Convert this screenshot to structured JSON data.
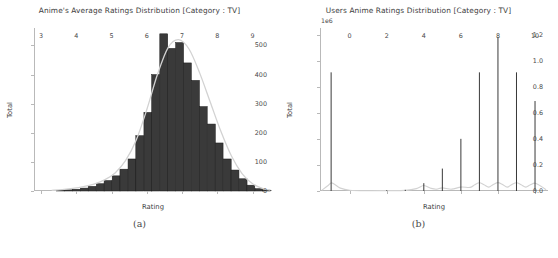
{
  "figure": {
    "width": 558,
    "height": 258,
    "background": "#ffffff",
    "footer_fragment": ""
  },
  "panels": [
    {
      "caption": "(a)",
      "chart_data": {
        "type": "bar",
        "title": "Anime's Average Ratings Distribution [Category : TV]",
        "xlabel": "Rating",
        "ylabel": "Total",
        "xlim": [
          2.8,
          9.55
        ],
        "ylim": [
          0,
          560
        ],
        "xticks": [
          3,
          4,
          5,
          6,
          7,
          8,
          9
        ],
        "xticklabels": [
          "3",
          "4",
          "5",
          "6",
          "7",
          "8",
          "9"
        ],
        "yticks": [
          0,
          100,
          200,
          300,
          400,
          500
        ],
        "yticklabels": [
          "0",
          "100",
          "200",
          "300",
          "400",
          "500"
        ],
        "grid": false,
        "legend": null,
        "bar_color": "#3a3a3a",
        "bar_edge_color": "#1a1a1a",
        "kde_color": "#d2d2d2",
        "bin_width": 0.225,
        "bin_centers": [
          3.55,
          3.78,
          4.0,
          4.23,
          4.45,
          4.68,
          4.9,
          5.13,
          5.35,
          5.58,
          5.8,
          6.03,
          6.25,
          6.48,
          6.7,
          6.93,
          7.15,
          7.38,
          7.6,
          7.83,
          8.05,
          8.28,
          8.5,
          8.73,
          8.95,
          9.18,
          9.4
        ],
        "values": [
          2,
          4,
          6,
          10,
          16,
          25,
          36,
          52,
          75,
          110,
          190,
          270,
          400,
          540,
          490,
          510,
          440,
          380,
          290,
          230,
          165,
          110,
          72,
          42,
          20,
          8,
          3
        ],
        "kde_points": [
          {
            "x": 3.3,
            "y": 2
          },
          {
            "x": 3.6,
            "y": 5
          },
          {
            "x": 3.9,
            "y": 9
          },
          {
            "x": 4.2,
            "y": 15
          },
          {
            "x": 4.5,
            "y": 24
          },
          {
            "x": 4.8,
            "y": 38
          },
          {
            "x": 5.1,
            "y": 62
          },
          {
            "x": 5.4,
            "y": 105
          },
          {
            "x": 5.7,
            "y": 175
          },
          {
            "x": 6.0,
            "y": 280
          },
          {
            "x": 6.3,
            "y": 400
          },
          {
            "x": 6.6,
            "y": 492
          },
          {
            "x": 6.9,
            "y": 520
          },
          {
            "x": 7.2,
            "y": 487
          },
          {
            "x": 7.5,
            "y": 405
          },
          {
            "x": 7.8,
            "y": 305
          },
          {
            "x": 8.1,
            "y": 205
          },
          {
            "x": 8.4,
            "y": 120
          },
          {
            "x": 8.7,
            "y": 60
          },
          {
            "x": 9.0,
            "y": 25
          },
          {
            "x": 9.3,
            "y": 8
          },
          {
            "x": 9.5,
            "y": 3
          }
        ]
      }
    },
    {
      "caption": "(b)",
      "chart_data": {
        "type": "bar",
        "title": "Users Anime Ratings Distribution [Category : TV]",
        "xlabel": "Rating",
        "ylabel": "Total",
        "y_exponent_label": "1e6",
        "xlim": [
          -1.6,
          10.7
        ],
        "ylim": [
          0,
          1250000
        ],
        "xticks": [
          0,
          2,
          4,
          6,
          8,
          10
        ],
        "xticklabels": [
          "0",
          "2",
          "4",
          "6",
          "8",
          "10"
        ],
        "yticks": [
          0,
          200000,
          400000,
          600000,
          800000,
          1000000,
          1200000
        ],
        "yticklabels": [
          "0.0",
          "0.2",
          "0.4",
          "0.6",
          "0.8",
          "1.0",
          "1.2"
        ],
        "grid": false,
        "legend": null,
        "bar_color": "#3a3a3a",
        "kde_color": "#d2d2d2",
        "categories": [
          -1,
          0,
          1,
          2,
          3,
          4,
          5,
          6,
          7,
          8,
          9,
          10
        ],
        "values": [
          910000,
          0,
          0,
          6000,
          9000,
          60000,
          172000,
          400000,
          910000,
          1180000,
          910000,
          690000
        ],
        "kde_points": [
          {
            "x": -1.5,
            "y": 6000
          },
          {
            "x": -1.2,
            "y": 38000
          },
          {
            "x": -1.0,
            "y": 62000
          },
          {
            "x": -0.8,
            "y": 50000
          },
          {
            "x": -0.5,
            "y": 22000
          },
          {
            "x": 0.0,
            "y": 6000
          },
          {
            "x": 1.0,
            "y": 2000
          },
          {
            "x": 2.0,
            "y": 3000
          },
          {
            "x": 3.0,
            "y": 5000
          },
          {
            "x": 3.6,
            "y": 18000
          },
          {
            "x": 4.0,
            "y": 42000
          },
          {
            "x": 4.4,
            "y": 20000
          },
          {
            "x": 4.7,
            "y": 14000
          },
          {
            "x": 5.0,
            "y": 24000
          },
          {
            "x": 5.5,
            "y": 14000
          },
          {
            "x": 6.0,
            "y": 30000
          },
          {
            "x": 6.5,
            "y": 28000
          },
          {
            "x": 6.75,
            "y": 48000
          },
          {
            "x": 7.0,
            "y": 63000
          },
          {
            "x": 7.25,
            "y": 48000
          },
          {
            "x": 7.5,
            "y": 30000
          },
          {
            "x": 7.75,
            "y": 50000
          },
          {
            "x": 8.0,
            "y": 64000
          },
          {
            "x": 8.25,
            "y": 50000
          },
          {
            "x": 8.5,
            "y": 30000
          },
          {
            "x": 8.75,
            "y": 50000
          },
          {
            "x": 9.0,
            "y": 63000
          },
          {
            "x": 9.25,
            "y": 48000
          },
          {
            "x": 9.5,
            "y": 30000
          },
          {
            "x": 9.75,
            "y": 48000
          },
          {
            "x": 10.0,
            "y": 60000
          },
          {
            "x": 10.3,
            "y": 38000
          },
          {
            "x": 10.6,
            "y": 10000
          }
        ]
      }
    }
  ]
}
